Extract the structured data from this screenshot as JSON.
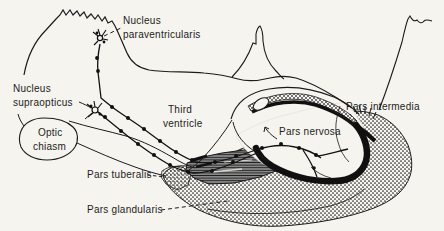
{
  "colors": {
    "background": "#f6f4ef",
    "ink": "#1c1c1c",
    "shaded_zone_gray": "#8f8f8f"
  },
  "labels": {
    "nucleus_paraventricularis": {
      "line1": "Nucleus",
      "line2": "paraventricularis"
    },
    "nucleus_supraopticus": {
      "line1": "Nucleus",
      "line2": "supraopticus"
    },
    "optic_chiasm": {
      "line1": "Optic",
      "line2": "chiasm"
    },
    "third_ventricle": {
      "line1": "Third",
      "line2": "ventricle"
    },
    "pars_intermedia": {
      "text": "Pars intermedia"
    },
    "pars_nervosa": {
      "text": "Pars nervosa"
    },
    "pars_tuberalis": {
      "text": "Pars tuberalis"
    },
    "pars_glandularis": {
      "text": "Pars glandularis"
    }
  }
}
